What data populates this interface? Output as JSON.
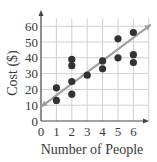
{
  "chart_data": {
    "type": "scatter",
    "title": "",
    "xlabel": "Number of People",
    "ylabel": "Cost ($)",
    "xlim": [
      0,
      7
    ],
    "ylim": [
      0,
      65
    ],
    "x_ticks": [
      0,
      1,
      2,
      3,
      4,
      5,
      6
    ],
    "y_ticks": [
      0,
      10,
      20,
      30,
      40,
      50,
      60
    ],
    "grid": true,
    "legend": null,
    "points": [
      {
        "x": 1,
        "y": 21
      },
      {
        "x": 1,
        "y": 13
      },
      {
        "x": 2,
        "y": 39
      },
      {
        "x": 2,
        "y": 35
      },
      {
        "x": 2,
        "y": 25
      },
      {
        "x": 2,
        "y": 17
      },
      {
        "x": 3,
        "y": 29
      },
      {
        "x": 4,
        "y": 38
      },
      {
        "x": 4,
        "y": 33
      },
      {
        "x": 5,
        "y": 52
      },
      {
        "x": 5,
        "y": 40
      },
      {
        "x": 6,
        "y": 56
      },
      {
        "x": 6,
        "y": 42
      },
      {
        "x": 6,
        "y": 37
      }
    ],
    "trend_line": {
      "x0": 0,
      "y0": 9,
      "x1": 7,
      "y1": 61,
      "style": "arrow-both"
    },
    "colors": {
      "points": "#333333",
      "trend_line": "#a0a0a0",
      "grid": "#d0d0d0",
      "axis": "#444444"
    }
  }
}
